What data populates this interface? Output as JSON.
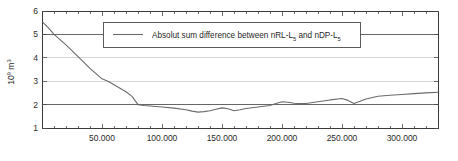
{
  "chart_data": {
    "type": "line",
    "title": "",
    "subtitle": "",
    "xlabel": "",
    "ylabel": "10⁹ m³",
    "ylabel_parts": {
      "base": "10",
      "exponent": "9",
      "unit": "m",
      "unit_exponent": "3"
    },
    "xlim": [
      0,
      330000
    ],
    "ylim": [
      1,
      6
    ],
    "grid": true,
    "grid_axis": "y",
    "legend_position": "top-center",
    "legend": [
      {
        "label": "Absolut sum  difference between nRL-L5 and nDP-L5",
        "label_parts": {
          "p1": "Absolut sum  difference between nRL-L",
          "sub1": "5",
          "p2": " and nDP-L",
          "sub2": "5"
        },
        "color": "#6b6b6b"
      }
    ],
    "xticks": [
      50000,
      100000,
      150000,
      200000,
      250000,
      300000
    ],
    "xticklabels": [
      "50.000",
      "100.000",
      "150.000",
      "200.000",
      "250.000",
      "300.000"
    ],
    "xminorticks": [
      10000,
      20000,
      30000,
      40000,
      60000,
      70000,
      80000,
      90000,
      110000,
      120000,
      130000,
      140000,
      160000,
      170000,
      180000,
      190000,
      210000,
      220000,
      230000,
      240000,
      260000,
      270000,
      280000,
      290000,
      310000,
      320000,
      330000
    ],
    "yticks": [
      1,
      2,
      3,
      4,
      5,
      6
    ],
    "yticklabels": [
      "1",
      "2",
      "3",
      "4",
      "5",
      "6"
    ],
    "gridlines_y": [
      2,
      3,
      4,
      5
    ],
    "series": [
      {
        "name": "Absolut sum  difference between nRL-L5 and nDP-L5",
        "color": "#6b6b6b",
        "x": [
          1000,
          5000,
          10000,
          20000,
          30000,
          40000,
          50000,
          55000,
          60000,
          65000,
          70000,
          75000,
          80000,
          85000,
          90000,
          100000,
          110000,
          120000,
          125000,
          130000,
          135000,
          140000,
          145000,
          150000,
          155000,
          160000,
          165000,
          170000,
          180000,
          190000,
          195000,
          200000,
          205000,
          210000,
          215000,
          220000,
          230000,
          240000,
          250000,
          255000,
          260000,
          265000,
          270000,
          280000,
          290000,
          300000,
          310000,
          320000,
          330000
        ],
        "y": [
          5.5,
          5.3,
          5.0,
          4.55,
          4.05,
          3.55,
          3.1,
          3.0,
          2.85,
          2.7,
          2.55,
          2.35,
          2.0,
          1.96,
          1.94,
          1.9,
          1.85,
          1.78,
          1.72,
          1.68,
          1.7,
          1.74,
          1.8,
          1.86,
          1.82,
          1.74,
          1.78,
          1.83,
          1.9,
          1.96,
          2.05,
          2.12,
          2.1,
          2.06,
          2.04,
          2.05,
          2.12,
          2.2,
          2.26,
          2.18,
          2.05,
          2.14,
          2.24,
          2.36,
          2.4,
          2.43,
          2.47,
          2.5,
          2.53
        ]
      }
    ]
  },
  "plot_geometry": {
    "left": 42,
    "right": 438,
    "top": 11,
    "bottom": 128
  },
  "legend_geometry": {
    "x": 103,
    "y": 22,
    "width": 257,
    "height": 25,
    "sample_x1": 113,
    "sample_x2": 143,
    "text_x": 152
  }
}
